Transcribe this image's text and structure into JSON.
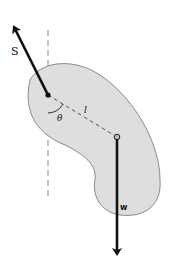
{
  "diagram": {
    "type": "physical-pendulum",
    "colors": {
      "background": "#ffffff",
      "body_fill": "#dedede",
      "body_stroke": "#8a8a8a",
      "vector": "#111111",
      "dashed": "#888888"
    },
    "labels": {
      "support_force": "S",
      "weight": "w",
      "length": "l",
      "angle": "θ"
    }
  }
}
